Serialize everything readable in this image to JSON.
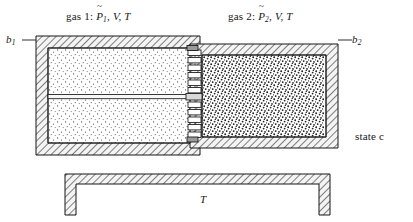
{
  "figure": {
    "state_label": "state c",
    "reservoir_label": "T",
    "labels": {
      "gas1_prefix": "gas 1:",
      "gas1_pressure_symbol": "P",
      "gas1_pressure_sub": "1",
      "gas1_rest": ", V, T",
      "gas2_prefix": "gas 2:",
      "gas2_pressure_symbol": "P",
      "gas2_pressure_sub": "2",
      "gas2_rest": ", V, T",
      "boundary_left": "b",
      "boundary_left_sub": "1",
      "boundary_right": "b",
      "boundary_right_sub": "2"
    },
    "variables": {
      "volume": "V",
      "temperature": "T",
      "pressure": "P"
    },
    "chambers": [
      {
        "id": "gas-1",
        "name": "gas 1",
        "pressure": "P̃1",
        "volume": "V",
        "temperature": "T",
        "stipple": "sparse",
        "boundary": "b1"
      },
      {
        "id": "gas-2",
        "name": "gas 2",
        "pressure": "P̃2",
        "volume": "V",
        "temperature": "T",
        "stipple": "dense",
        "boundary": "b2"
      }
    ],
    "components": [
      "left-chamber-wall",
      "right-chamber-wall",
      "piston-rod",
      "coupling-spring",
      "heat-reservoir"
    ],
    "colors": {
      "ink": "#161616",
      "hatch": "#2b2b2b",
      "wall_fill": "#f2f2f2",
      "gas1_dot": "#555555",
      "gas2_dot": "#1d1d1d",
      "background": "#ffffff"
    }
  }
}
